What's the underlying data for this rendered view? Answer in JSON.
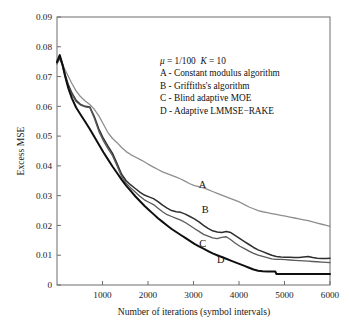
{
  "chart_data": {
    "type": "line",
    "title": "",
    "xlabel": "Number of iterations (symbol intervals)",
    "ylabel": "Excess MSE",
    "xlim": [
      0,
      6000
    ],
    "ylim": [
      0,
      0.09
    ],
    "xticks": [
      1000,
      2000,
      3000,
      4000,
      5000,
      6000
    ],
    "xtick_labels": [
      "1000",
      "2000",
      "3000",
      "4000",
      "5000",
      "6000"
    ],
    "yticks": [
      0,
      0.01,
      0.02,
      0.03,
      0.04,
      0.05,
      0.06,
      0.07,
      0.08,
      0.09
    ],
    "ytick_labels": [
      "0",
      "0.01",
      "0.02",
      "0.03",
      "0.04",
      "0.05",
      "0.06",
      "0.07",
      "0.08",
      "0.09"
    ],
    "grid": false,
    "legend_position": "annotation-inside-upper-right",
    "annotation_lines": [
      "μ = 1/100  K = 10",
      "A - Constant modulus algorithm",
      "B - Griffiths's algorithm",
      "C - Blind adaptive MOE",
      "D - Adaptive LMMSE−RAKE"
    ],
    "parameters": {
      "mu_symbol": "μ",
      "mu_value": "1/100",
      "K_symbol": "K",
      "K_value": "10"
    },
    "series": [
      {
        "name": "A",
        "label": "A - Constant modulus algorithm",
        "color": "#8e8e8e",
        "width": 1.3,
        "label_x": 3200,
        "label_y": 0.0325,
        "x": [
          0,
          60,
          120,
          180,
          250,
          330,
          420,
          520,
          620,
          720,
          820,
          920,
          1020,
          1120,
          1220,
          1320,
          1420,
          1520,
          1620,
          1720,
          1820,
          1920,
          2020,
          2120,
          2220,
          2320,
          2420,
          2520,
          2620,
          2720,
          2820,
          2920,
          3020,
          3120,
          3220,
          3320,
          3420,
          3520,
          3620,
          3720,
          3820,
          3920,
          4020,
          4120,
          4220,
          4320,
          4420,
          4520,
          4620,
          4720,
          4820,
          4920,
          5020,
          5120,
          5220,
          5320,
          5420,
          5520,
          5620,
          5720,
          5820,
          5920,
          6000
        ],
        "y": [
          0.0748,
          0.0758,
          0.0742,
          0.0722,
          0.07,
          0.0676,
          0.0652,
          0.0632,
          0.0618,
          0.0606,
          0.059,
          0.0568,
          0.054,
          0.0512,
          0.0492,
          0.0478,
          0.0462,
          0.0448,
          0.0438,
          0.043,
          0.0422,
          0.0414,
          0.0404,
          0.0396,
          0.0388,
          0.038,
          0.0374,
          0.0368,
          0.0362,
          0.0356,
          0.0348,
          0.034,
          0.0334,
          0.033,
          0.0326,
          0.032,
          0.0314,
          0.0308,
          0.0302,
          0.0296,
          0.029,
          0.0284,
          0.0278,
          0.027,
          0.0262,
          0.0256,
          0.025,
          0.0246,
          0.0243,
          0.024,
          0.0237,
          0.0234,
          0.0231,
          0.0228,
          0.0225,
          0.0222,
          0.0219,
          0.0216,
          0.0212,
          0.0208,
          0.0204,
          0.02,
          0.0197
        ]
      },
      {
        "name": "B",
        "label": "B - Griffiths's algorithm",
        "color": "#2e2e2e",
        "width": 1.5,
        "label_x": 3260,
        "label_y": 0.0243,
        "x": [
          0,
          60,
          120,
          180,
          250,
          330,
          420,
          520,
          620,
          720,
          820,
          920,
          1020,
          1120,
          1220,
          1320,
          1420,
          1520,
          1620,
          1720,
          1820,
          1920,
          2020,
          2120,
          2220,
          2320,
          2420,
          2520,
          2620,
          2720,
          2820,
          2920,
          3020,
          3120,
          3220,
          3320,
          3420,
          3520,
          3620,
          3720,
          3820,
          3920,
          4020,
          4120,
          4220,
          4320,
          4420,
          4520,
          4620,
          4720,
          4820,
          4920,
          5020,
          5120,
          5220,
          5320,
          5420,
          5520,
          5620,
          5720,
          5820,
          5920,
          6000
        ],
        "y": [
          0.0752,
          0.077,
          0.0742,
          0.0706,
          0.0672,
          0.0644,
          0.062,
          0.0606,
          0.06,
          0.0598,
          0.0566,
          0.0524,
          0.0492,
          0.0466,
          0.0442,
          0.0408,
          0.0372,
          0.035,
          0.0336,
          0.0324,
          0.0312,
          0.0302,
          0.0296,
          0.029,
          0.028,
          0.0268,
          0.0258,
          0.025,
          0.0246,
          0.0244,
          0.0238,
          0.023,
          0.0222,
          0.0212,
          0.02,
          0.019,
          0.0182,
          0.0178,
          0.0176,
          0.018,
          0.0176,
          0.0166,
          0.0156,
          0.0146,
          0.0136,
          0.0126,
          0.0118,
          0.0112,
          0.0106,
          0.01,
          0.0096,
          0.0094,
          0.0093,
          0.0093,
          0.0092,
          0.0092,
          0.0094,
          0.0096,
          0.0092,
          0.009,
          0.0089,
          0.0089,
          0.009
        ]
      },
      {
        "name": "C",
        "label": "C - Blind adaptive MOE",
        "color": "#5a5a5a",
        "width": 1.3,
        "label_x": 3200,
        "label_y": 0.0128,
        "x": [
          0,
          60,
          120,
          180,
          250,
          330,
          420,
          520,
          620,
          720,
          820,
          920,
          1020,
          1120,
          1220,
          1320,
          1420,
          1520,
          1620,
          1720,
          1820,
          1920,
          2020,
          2120,
          2220,
          2320,
          2420,
          2520,
          2620,
          2720,
          2820,
          2920,
          3020,
          3120,
          3220,
          3320,
          3420,
          3520,
          3620,
          3720,
          3820,
          3920,
          4020,
          4120,
          4220,
          4320,
          4420,
          4520,
          4620,
          4720,
          4820,
          4920,
          5020,
          5120,
          5220,
          5320,
          5420,
          5520,
          5620,
          5720,
          5820,
          5920,
          6000
        ],
        "y": [
          0.0742,
          0.0762,
          0.0736,
          0.07,
          0.0666,
          0.064,
          0.0616,
          0.0604,
          0.0598,
          0.0596,
          0.056,
          0.0516,
          0.0484,
          0.0458,
          0.0434,
          0.04,
          0.0364,
          0.0342,
          0.0326,
          0.0312,
          0.0298,
          0.0286,
          0.0278,
          0.027,
          0.0258,
          0.0246,
          0.0236,
          0.023,
          0.0224,
          0.0218,
          0.021,
          0.02,
          0.019,
          0.018,
          0.017,
          0.0164,
          0.0158,
          0.0156,
          0.016,
          0.0162,
          0.0152,
          0.014,
          0.013,
          0.0122,
          0.0114,
          0.0106,
          0.01,
          0.0096,
          0.0092,
          0.0088,
          0.0086,
          0.0086,
          0.0085,
          0.0084,
          0.0083,
          0.0082,
          0.0081,
          0.008,
          0.0079,
          0.0078,
          0.0077,
          0.0076,
          0.0075
        ]
      },
      {
        "name": "D",
        "label": "D - Adaptive LMMSE−RAKE",
        "color": "#0f0f0f",
        "width": 2.0,
        "label_x": 3600,
        "label_y": 0.0073,
        "x": [
          0,
          60,
          120,
          180,
          250,
          330,
          420,
          520,
          620,
          720,
          820,
          920,
          1020,
          1120,
          1220,
          1320,
          1420,
          1520,
          1620,
          1720,
          1820,
          1920,
          2020,
          2120,
          2220,
          2320,
          2420,
          2520,
          2620,
          2720,
          2820,
          2920,
          3020,
          3120,
          3220,
          3320,
          3420,
          3520,
          3620,
          3720,
          3820,
          3920,
          4020,
          4120,
          4220,
          4320,
          4420,
          4520,
          4620,
          4720,
          4800,
          4820,
          4920,
          5020,
          5120,
          5220,
          5320,
          5420,
          5520,
          5620,
          5720,
          5820,
          5920,
          6000
        ],
        "y": [
          0.0748,
          0.0772,
          0.074,
          0.07,
          0.066,
          0.0626,
          0.0596,
          0.0572,
          0.0548,
          0.0524,
          0.0498,
          0.0472,
          0.0446,
          0.0422,
          0.0398,
          0.0376,
          0.0354,
          0.0334,
          0.0316,
          0.0298,
          0.0282,
          0.0266,
          0.0252,
          0.0238,
          0.0224,
          0.0212,
          0.02,
          0.0188,
          0.0178,
          0.0168,
          0.0158,
          0.0148,
          0.0138,
          0.013,
          0.0122,
          0.0114,
          0.0106,
          0.01,
          0.0094,
          0.0088,
          0.0082,
          0.0076,
          0.007,
          0.0064,
          0.0058,
          0.0052,
          0.0048,
          0.0046,
          0.0045,
          0.0045,
          0.0045,
          0.0037,
          0.0037,
          0.0037,
          0.0037,
          0.0037,
          0.0037,
          0.0037,
          0.0037,
          0.0037,
          0.0037,
          0.0037,
          0.0037,
          0.0037
        ]
      }
    ]
  },
  "axes_geometry": {
    "left": 57,
    "right": 330,
    "top": 17,
    "bottom": 285
  }
}
